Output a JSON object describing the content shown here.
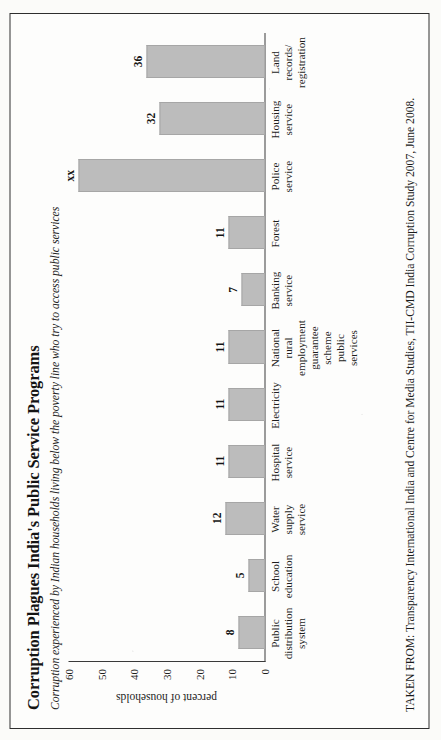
{
  "figure": {
    "title": "Corruption Plagues India's Public Service Programs",
    "subtitle": "Corruption experienced by Indian households living below the poverty line who try to access public services",
    "source": "TAKEN FROM: Transparency International India and Centre for Media Studies, TII-CMD India Corruption Study 2007, June 2008."
  },
  "chart_data": {
    "type": "bar",
    "title": "Corruption Plagues India's Public Service Programs",
    "subtitle": "Corruption experienced by Indian households living below the poverty line who try to access public services",
    "xlabel": "",
    "ylabel": "percent of households",
    "ylim": [
      0,
      60
    ],
    "yticks": [
      0,
      10,
      20,
      30,
      40,
      50,
      60
    ],
    "grid": false,
    "legend": null,
    "categories": [
      "Public distribution system",
      "School education",
      "Water supply service",
      "Hospital service",
      "Electricity",
      "National rural employment guarantee scheme public services",
      "Banking service",
      "Forest",
      "Police service",
      "Housing service",
      "Land records/ registration"
    ],
    "values": [
      8,
      5,
      12,
      11,
      11,
      11,
      7,
      11,
      57,
      32,
      36
    ],
    "value_labels": [
      "8",
      "5",
      "12",
      "11",
      "11",
      "11",
      "7",
      "11",
      "xx",
      "32",
      "36"
    ],
    "bar_color": "#bcbcbc",
    "axis_color": "#3a3a3a"
  },
  "categories_display": [
    {
      "lines": [
        "Public",
        "distribution",
        "system"
      ]
    },
    {
      "lines": [
        "School",
        "education"
      ]
    },
    {
      "lines": [
        "Water",
        "supply",
        "service"
      ]
    },
    {
      "lines": [
        "Hospital",
        "service"
      ]
    },
    {
      "lines": [
        "Electricity"
      ]
    },
    {
      "lines": [
        "National",
        "rural",
        "employment",
        "guarantee",
        "scheme",
        "public services"
      ]
    },
    {
      "lines": [
        "Banking",
        "service"
      ]
    },
    {
      "lines": [
        "Forest"
      ]
    },
    {
      "lines": [
        "Police",
        "service"
      ]
    },
    {
      "lines": [
        "Housing",
        "service"
      ]
    },
    {
      "lines": [
        "Land",
        "records/",
        "registration"
      ]
    }
  ]
}
